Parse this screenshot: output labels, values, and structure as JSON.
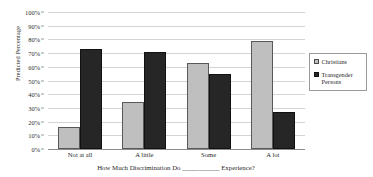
{
  "chart_data": {
    "type": "bar",
    "title": "",
    "subtitle": "",
    "xlabel": "How Much Discrimination Do ___________ Experience?",
    "ylabel": "Predicted Percentage",
    "categories": [
      "Not at all",
      "A little",
      "Some",
      "A lot"
    ],
    "series": [
      {
        "name": "Christians",
        "color": "#BFBFBF",
        "values": [
          16,
          34,
          63,
          79
        ]
      },
      {
        "name": "Transgender Persons",
        "color": "#262626",
        "values": [
          73,
          71,
          55,
          27
        ]
      }
    ],
    "ylim": [
      0,
      100
    ],
    "ytick_values": [
      0,
      10,
      20,
      30,
      40,
      50,
      60,
      70,
      80,
      90,
      100
    ],
    "ytick_labels": [
      "0%",
      "10%",
      "20%",
      "30%",
      "40%",
      "50%",
      "60%",
      "70%",
      "80%",
      "90%",
      "100%"
    ],
    "grid": "horizontal",
    "legend_position": "right",
    "legend_entries": [
      "Christians",
      "Transgender Persons"
    ]
  },
  "legend": {
    "entries": [
      {
        "label": "Christians",
        "swatch": "christians"
      },
      {
        "label": "Transgender Persons",
        "swatch": "transgender"
      }
    ]
  }
}
